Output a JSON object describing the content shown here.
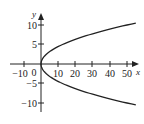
{
  "chart_data": {
    "type": "line",
    "title": "",
    "xlabel": "x",
    "ylabel": "y",
    "equation": "x = y^2 / 2",
    "xlim": [
      -12,
      55
    ],
    "ylim": [
      -12,
      12
    ],
    "x_ticks": [
      -10,
      10,
      20,
      30,
      40,
      50
    ],
    "y_ticks": [
      -10,
      -5,
      5,
      10
    ],
    "x_tick_labels": [
      "-10",
      "10",
      "20",
      "30",
      "40",
      "50"
    ],
    "y_tick_labels": [
      "-10",
      "-5",
      "5",
      "10"
    ],
    "origin_label": "0",
    "grid": false,
    "legend": null,
    "series": [
      {
        "name": "parabola",
        "x": [
          55.1,
          50,
          40.5,
          32,
          24.5,
          18,
          12.5,
          8,
          4.5,
          2,
          0.5,
          0,
          0.5,
          2,
          4.5,
          8,
          12.5,
          18,
          24.5,
          32,
          40.5,
          50,
          55.1
        ],
        "y": [
          10.5,
          10,
          9,
          8,
          7,
          6,
          5,
          4,
          3,
          2,
          1,
          0,
          -1,
          -2,
          -3,
          -4,
          -5,
          -6,
          -7,
          -8,
          -9,
          -10,
          -10.5
        ]
      }
    ]
  },
  "labels": {
    "x_axis": "x",
    "y_axis": "y",
    "origin": "0",
    "xt": [
      "−10",
      "10",
      "20",
      "30",
      "40",
      "50"
    ],
    "yt": [
      "10",
      "5",
      "−5",
      "−10"
    ]
  }
}
